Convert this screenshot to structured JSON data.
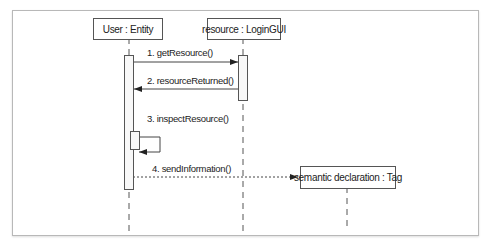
{
  "diagram": {
    "type": "UML sequence diagram",
    "lifelines": [
      {
        "id": "user",
        "label": "User : Entity"
      },
      {
        "id": "resource",
        "label": "resource : LoginGUI"
      },
      {
        "id": "tag",
        "label": "semantic declaration : Tag"
      }
    ],
    "messages": [
      {
        "label": "1. getResource()",
        "from": "user",
        "to": "resource",
        "style": "solid"
      },
      {
        "label": "2. resourceReturned()",
        "from": "resource",
        "to": "user",
        "style": "solid"
      },
      {
        "label": "3. inspectResource()",
        "from": "user",
        "to": "user",
        "style": "self"
      },
      {
        "label": "4. sendInformation()",
        "from": "user",
        "to": "tag",
        "style": "dotted-create"
      }
    ],
    "colors": {
      "line": "#555555",
      "frame": "#b8b8b8"
    }
  }
}
